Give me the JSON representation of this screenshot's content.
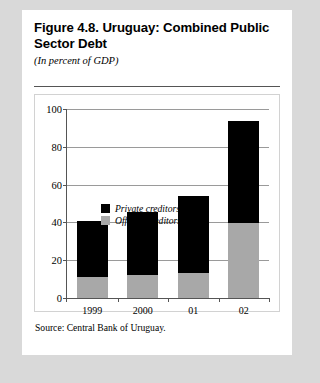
{
  "figure": {
    "title": "Figure 4.8. Uruguay: Combined Public Sector Debt",
    "subtitle": "(In percent of GDP)",
    "source": "Source: Central Bank of Uruguay."
  },
  "colors": {
    "private": "#000000",
    "official": "#a8a8a8",
    "gridline": "#9a9a9a",
    "axis": "#555555",
    "card": "#ffffff",
    "page": "#d9d9d9"
  },
  "chart_data": {
    "type": "bar",
    "title": "Figure 4.8. Uruguay: Combined Public Sector Debt",
    "subtitle": "(In percent of GDP)",
    "stacked": true,
    "xlabel": "",
    "ylabel": "",
    "ylim": [
      0,
      100
    ],
    "yticks": [
      0,
      20,
      40,
      60,
      80,
      100
    ],
    "ytick_labels": [
      "0",
      "20",
      "40",
      "60",
      "80",
      "100"
    ],
    "grid": true,
    "legend_position": "upper-left-inside",
    "categories": [
      "1999",
      "2000",
      "01",
      "02"
    ],
    "series": [
      {
        "name": "Official creditors",
        "values": [
          11.0,
          12.3,
          13.5,
          39.5
        ]
      },
      {
        "name": "Private creditors",
        "values": [
          29.5,
          33.2,
          40.5,
          54.0
        ]
      }
    ],
    "totals": [
      40.5,
      45.5,
      54.0,
      93.5
    ],
    "annotations": [
      "Source: Central Bank of Uruguay."
    ]
  }
}
